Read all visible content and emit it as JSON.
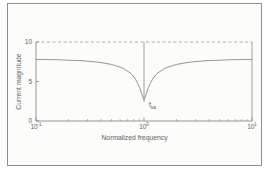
{
  "figure": {
    "background": "#fcfcfa",
    "border_color": "#8f8f88"
  },
  "chart_data": {
    "type": "line",
    "title": "",
    "xlabel": "Normalized frequency",
    "ylabel": "Current magnitude",
    "x_scale": "log",
    "xlim": [
      0.1,
      10
    ],
    "ylim": [
      0,
      10
    ],
    "grid": false,
    "legend": "none",
    "xticks": [
      {
        "value": 0.1,
        "base": "10",
        "exp": "-1"
      },
      {
        "value": 1,
        "base": "10",
        "exp": "0"
      },
      {
        "value": 10,
        "base": "10",
        "exp": "1"
      }
    ],
    "yticks": [
      {
        "value": 10,
        "label": "10"
      },
      {
        "value": 5,
        "label": "5"
      },
      {
        "value": 0,
        "label": "0"
      }
    ],
    "top_boundary": {
      "y": 10,
      "style": "dashed"
    },
    "series": [
      {
        "name": "current-magnitude-response",
        "points": [
          [
            0.1,
            7.8
          ],
          [
            0.158,
            7.75
          ],
          [
            0.251,
            7.65
          ],
          [
            0.316,
            7.55
          ],
          [
            0.398,
            7.4
          ],
          [
            0.501,
            7.15
          ],
          [
            0.562,
            6.95
          ],
          [
            0.631,
            6.7
          ],
          [
            0.708,
            6.3
          ],
          [
            0.759,
            6.0
          ],
          [
            0.794,
            5.7
          ],
          [
            0.832,
            5.3
          ],
          [
            0.871,
            4.8
          ],
          [
            0.912,
            4.2
          ],
          [
            0.944,
            3.6
          ],
          [
            0.966,
            3.2
          ],
          [
            0.982,
            2.95
          ],
          [
            1.0,
            2.7
          ],
          [
            1.019,
            2.95
          ],
          [
            1.035,
            3.2
          ],
          [
            1.059,
            3.6
          ],
          [
            1.096,
            4.2
          ],
          [
            1.148,
            4.8
          ],
          [
            1.202,
            5.3
          ],
          [
            1.259,
            5.7
          ],
          [
            1.318,
            6.0
          ],
          [
            1.413,
            6.3
          ],
          [
            1.585,
            6.7
          ],
          [
            1.778,
            6.95
          ],
          [
            1.995,
            7.15
          ],
          [
            2.512,
            7.4
          ],
          [
            3.162,
            7.55
          ],
          [
            3.981,
            7.65
          ],
          [
            6.31,
            7.75
          ],
          [
            10,
            7.8
          ]
        ]
      }
    ],
    "annotations": [
      {
        "base": "f",
        "sub": "sa",
        "x": 1,
        "marker_line_from_y": 10,
        "marker_line_to_y": 2.4
      }
    ],
    "colors": {
      "axis": "#8a8a85",
      "dashed": "#9a9a95",
      "curve": "#96968f",
      "marker_line": "#8a8a85",
      "text": "#63635f"
    }
  }
}
